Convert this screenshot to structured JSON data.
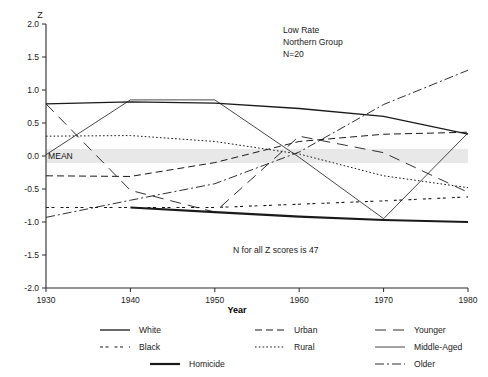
{
  "chart_data": {
    "type": "line",
    "title": "",
    "xlabel": "Year",
    "ylabel": "Z",
    "xlim": [
      1930,
      1980
    ],
    "ylim": [
      -2.0,
      2.0
    ],
    "grid": false,
    "legend_position": "bottom",
    "x": [
      1930,
      1940,
      1950,
      1960,
      1970,
      1980
    ],
    "xticks": [
      "1930",
      "1940",
      "1950",
      "1960",
      "1970",
      "1980"
    ],
    "yticks": [
      "2.0",
      "1.5",
      "1.0",
      "0.5",
      "0.0",
      "-0.5",
      "-1.0",
      "-1.5",
      "-2.0"
    ],
    "mean_line": 0.0,
    "mean_label": "MEAN",
    "annotations": [
      "Low Rate",
      "Northern Group",
      "N=20",
      "N for all Z scores is 47"
    ],
    "series": [
      {
        "name": "White",
        "style": "solid-thin",
        "x": [
          1930,
          1940,
          1950,
          1960,
          1970,
          1980
        ],
        "values": [
          0.79,
          0.82,
          0.8,
          0.72,
          0.6,
          0.33
        ]
      },
      {
        "name": "Black",
        "style": "dash-dot-dot",
        "x": [
          1930,
          1940,
          1950,
          1960,
          1970,
          1980
        ],
        "values": [
          -0.78,
          -0.78,
          -0.78,
          -0.73,
          -0.68,
          -0.62
        ]
      },
      {
        "name": "Homicide",
        "style": "solid-thick",
        "x": [
          1940,
          1950,
          1960,
          1970,
          1980
        ],
        "values": [
          -0.78,
          -0.85,
          -0.92,
          -0.97,
          -1.0
        ]
      },
      {
        "name": "Urban",
        "style": "dashed",
        "x": [
          1930,
          1940,
          1950,
          1960,
          1970,
          1980
        ],
        "values": [
          -0.3,
          -0.31,
          -0.1,
          0.22,
          0.33,
          0.36
        ]
      },
      {
        "name": "Rural",
        "style": "dotted",
        "x": [
          1930,
          1940,
          1950,
          1960,
          1970,
          1980
        ],
        "values": [
          0.3,
          0.31,
          0.22,
          0.03,
          -0.3,
          -0.48
        ]
      },
      {
        "name": "Younger",
        "style": "long-dash",
        "x": [
          1930,
          1940,
          1950,
          1960,
          1970,
          1980
        ],
        "values": [
          0.79,
          -0.52,
          -0.85,
          0.3,
          0.05,
          -0.55
        ]
      },
      {
        "name": "Middle-Aged",
        "style": "solid-thin2",
        "x": [
          1930,
          1940,
          1950,
          1960,
          1970,
          1980
        ],
        "values": [
          0.02,
          0.85,
          0.85,
          -0.02,
          -0.95,
          0.35
        ]
      },
      {
        "name": "Older",
        "style": "dash-dot",
        "x": [
          1930,
          1940,
          1950,
          1960,
          1970,
          1980
        ],
        "values": [
          -0.93,
          -0.67,
          -0.42,
          0.06,
          0.78,
          1.3
        ]
      }
    ]
  },
  "legend": {
    "columns": [
      [
        {
          "label": "White",
          "style": "solid-thin"
        },
        {
          "label": "Black",
          "style": "dash-dot-dot"
        }
      ],
      [
        {
          "label": "Urban",
          "style": "dashed"
        },
        {
          "label": "Rural",
          "style": "dotted"
        }
      ],
      [
        {
          "label": "Younger",
          "style": "long-dash"
        },
        {
          "label": "Middle-Aged",
          "style": "solid-thin2"
        }
      ]
    ],
    "bottom_row": [
      {
        "label": "Homicide",
        "style": "solid-thick"
      },
      {
        "label": "Older",
        "style": "dash-dot"
      }
    ]
  },
  "colors": {
    "ink": "#1a1a1a",
    "mean_band": "#e8e8e8",
    "background": "#ffffff"
  }
}
